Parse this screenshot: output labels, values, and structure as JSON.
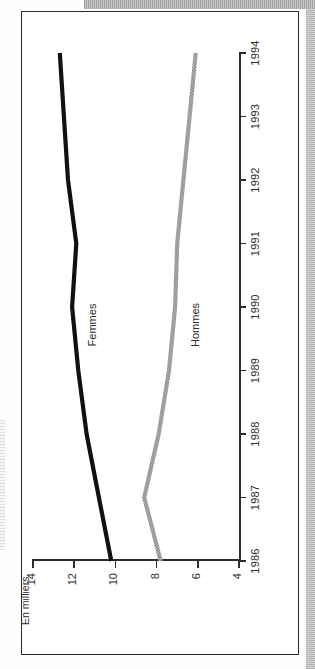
{
  "figure": {
    "unit_label": "En milliers",
    "orientation_note": "rotated"
  },
  "chart_data": {
    "type": "line",
    "title": "",
    "subtitle": "",
    "xlabel": "",
    "ylabel": "En milliers",
    "unit": "En milliers",
    "x": [
      1986,
      1987,
      1988,
      1989,
      1990,
      1991,
      1992,
      1993,
      1994
    ],
    "tick_labels_x": [
      "1986",
      "1987",
      "1988",
      "1989",
      "1990",
      "1991",
      "1992",
      "1993",
      "1994"
    ],
    "tick_labels_y": [
      "14",
      "12",
      "10",
      "8",
      "6",
      "4"
    ],
    "ticks_y": [
      14,
      12,
      10,
      8,
      6,
      4
    ],
    "ylim": [
      4,
      14
    ],
    "xlim": [
      1986,
      1994
    ],
    "grid": false,
    "legend": "inline-labels",
    "series": [
      {
        "name": "Femmes",
        "color": "#111111",
        "style": "solid-thick",
        "values": [
          10.2,
          10.8,
          11.4,
          11.8,
          12.1,
          11.9,
          12.3,
          12.5,
          12.7
        ],
        "label": "Femmes",
        "label_at_year": 1990
      },
      {
        "name": "Hommes",
        "color": "#9a9a9a",
        "style": "solid-thick-halftone",
        "values": [
          7.8,
          8.6,
          7.9,
          7.4,
          7.1,
          7.0,
          6.7,
          6.4,
          6.1
        ],
        "label": "Hommes",
        "label_at_year": 1990
      }
    ]
  }
}
